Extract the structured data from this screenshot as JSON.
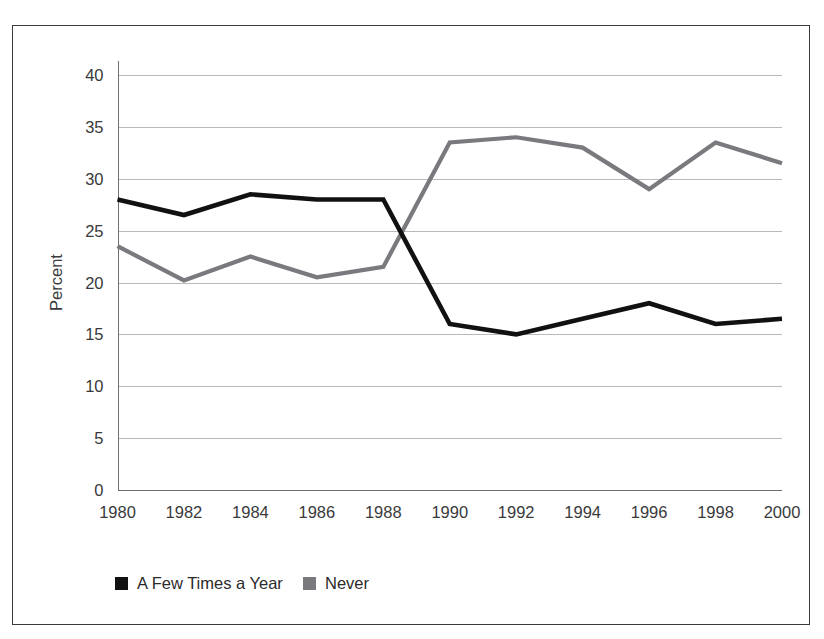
{
  "figure": {
    "frame_border_color": "#3b3b3f",
    "background_color": "#ffffff"
  },
  "chart_data": {
    "type": "line",
    "title": "",
    "subtitle": "",
    "xlabel": "",
    "ylabel": "Percent",
    "categories": [
      1980,
      1982,
      1984,
      1986,
      1988,
      1990,
      1992,
      1994,
      1996,
      1998,
      2000
    ],
    "x_tick_labels": [
      "1980",
      "1982",
      "1984",
      "1986",
      "1988",
      "1990",
      "1992",
      "1994",
      "1996",
      "1998",
      "2000"
    ],
    "y_tick_labels": [
      "0",
      "5",
      "10",
      "15",
      "20",
      "25",
      "30",
      "35",
      "40"
    ],
    "y_ticks": [
      0,
      5,
      10,
      15,
      20,
      25,
      30,
      35,
      40
    ],
    "ylim": [
      0,
      40
    ],
    "xlim": [
      1980,
      2000
    ],
    "grid": "horizontal",
    "legend_position": "bottom",
    "series": [
      {
        "name": "A Few Times a Year",
        "color": "#111111",
        "line_width": 4.6,
        "values": [
          28.0,
          26.5,
          28.5,
          28.0,
          28.0,
          16.0,
          15.0,
          16.5,
          18.0,
          16.0,
          16.5
        ]
      },
      {
        "name": "Never",
        "color": "#7a7a7e",
        "line_width": 4.2,
        "values": [
          23.5,
          20.2,
          22.5,
          20.5,
          21.5,
          33.5,
          34.0,
          33.0,
          29.0,
          33.5,
          31.5
        ]
      }
    ]
  },
  "legend": {
    "entries": [
      {
        "label": "A Few Times a Year",
        "color": "#111111"
      },
      {
        "label": "Never",
        "color": "#7a7a7e"
      }
    ]
  }
}
